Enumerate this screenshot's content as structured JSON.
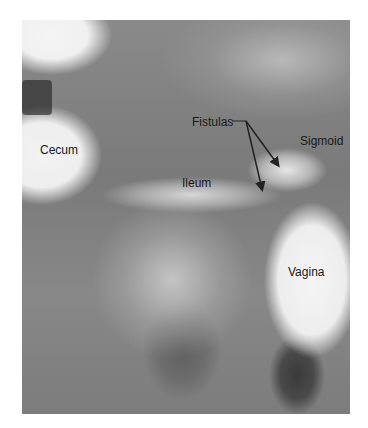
{
  "figure": {
    "type": "radiograph",
    "labels": {
      "cecum": "Cecum",
      "fistulas": "Fistulas",
      "sigmoid": "Sigmoid",
      "ileum": "Ileum",
      "vagina": "Vagina"
    }
  }
}
